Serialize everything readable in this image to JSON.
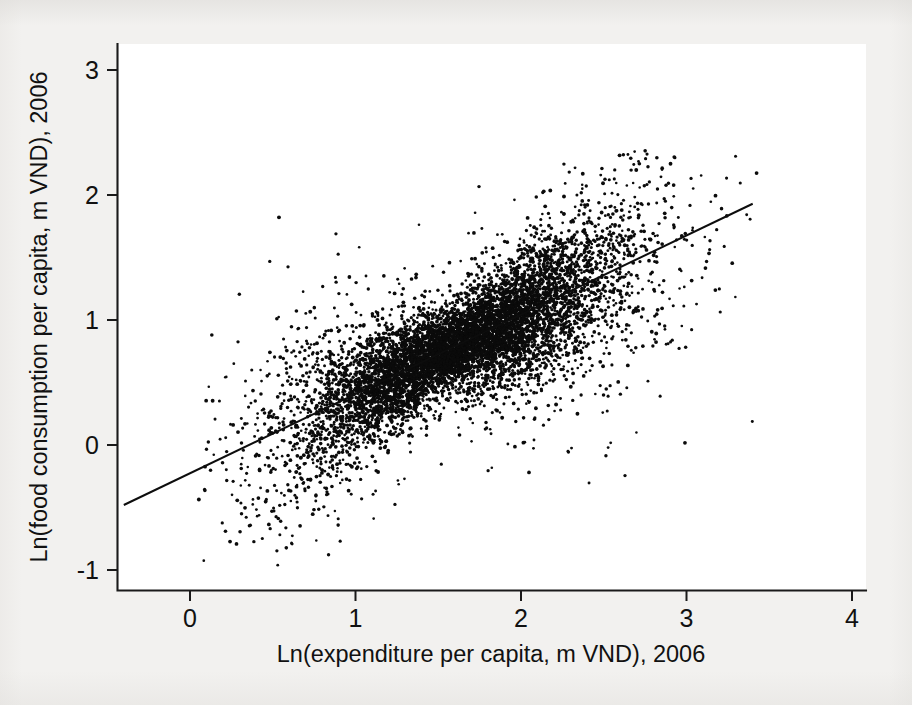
{
  "figure": {
    "title": "",
    "background_color": "#f2f1ef",
    "plot_area_color": "#ffffff",
    "point_color": "#0b0b0b",
    "line_color": "#0d0d0d",
    "axis_color": "#1a1a1a"
  },
  "axes": {
    "x_title": "Ln(expenditure per capita, m VND), 2006",
    "y_title": "Ln(food consumption per capita, m VND), 2006",
    "x_ticks": [
      "0",
      "1",
      "2",
      "3",
      "4"
    ],
    "y_ticks": [
      "3",
      "2",
      "1",
      "0",
      "-1"
    ]
  },
  "chart_data": {
    "type": "scatter",
    "title": "",
    "xlabel": "Ln(expenditure per capita, m VND), 2006",
    "ylabel": "Ln(food consumption per capita, m VND), 2006",
    "xlim": [
      -0.45,
      4.05
    ],
    "ylim": [
      -1.28,
      3.18
    ],
    "xticks": [
      0,
      1,
      2,
      3,
      4
    ],
    "yticks": [
      -1,
      0,
      1,
      2,
      3
    ],
    "grid": false,
    "legend": null,
    "n_points": 8200,
    "marker": "filled-circle",
    "marker_size_px": 2.6,
    "point_color": "#0b0b0b",
    "series": [
      {
        "name": "Households",
        "description": "Dense heteroscedastic cloud of household observations; log food consumption rises with log total expenditure. Bulk of mass between x=0.8 and x=2.6, y=0.2 to y=1.6. Spread widens at low x and at high x; a few sparse outliers reach y=-1.0 near x=0.2 and y=2.35 near x=2.6.",
        "x_range": [
          0.05,
          3.45
        ],
        "y_range": [
          -1.02,
          2.36
        ],
        "x_mean": 1.62,
        "y_mean": 0.84,
        "correlation": 0.86,
        "density_peak_xy": [
          1.55,
          0.76
        ]
      }
    ],
    "fit_line": {
      "name": "Linear fit",
      "x_start": -0.4,
      "y_start": -0.48,
      "x_end": 3.4,
      "y_end": 1.93,
      "slope": 0.634,
      "intercept": -0.226
    },
    "annotations": []
  }
}
